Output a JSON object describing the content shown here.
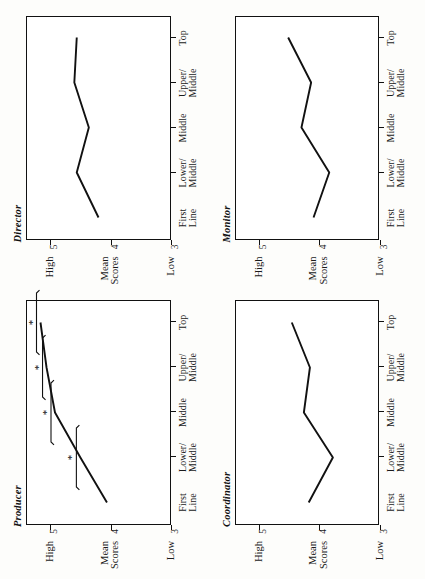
{
  "figure": {
    "orientation": "rotated-90-ccw",
    "layout": "2x2 grid of line charts",
    "y_axis_label_top": "High",
    "y_axis_label_mid_line1": "Mean",
    "y_axis_label_mid_line2": "Scores",
    "y_axis_label_bottom": "Low",
    "ytick_5": "5",
    "ytick_4": "4",
    "ytick_3": "3",
    "significance_marker": "*"
  },
  "categories": [
    {
      "line1": "First",
      "line2": "Line"
    },
    {
      "line1": "Lower/",
      "line2": "Middle"
    },
    {
      "line1": "Middle",
      "line2": ""
    },
    {
      "line1": "Upper/",
      "line2": "Middle"
    },
    {
      "line1": "Top",
      "line2": ""
    }
  ],
  "chart_data": [
    {
      "type": "line",
      "title": "Director",
      "categories": [
        "First Line",
        "Lower/Middle",
        "Middle",
        "Upper/Middle",
        "Top"
      ],
      "values": [
        4.2,
        4.56,
        4.36,
        4.6,
        4.56
      ],
      "xlabel": "",
      "ylabel": "Mean Scores",
      "ylim": [
        3,
        5.4
      ],
      "yticks": [
        3,
        4,
        5
      ],
      "ytick_labels": [
        "3",
        "4",
        "5"
      ],
      "grid": false,
      "legend": "none",
      "annotations": []
    },
    {
      "type": "line",
      "title": "Monitor",
      "categories": [
        "First Line",
        "Lower/Middle",
        "Middle",
        "Upper/Middle",
        "Top"
      ],
      "values": [
        4.1,
        3.84,
        4.3,
        4.14,
        4.52
      ],
      "xlabel": "",
      "ylabel": "Mean Scores",
      "ylim": [
        3,
        5.4
      ],
      "yticks": [
        3,
        4,
        5
      ],
      "ytick_labels": [
        "3",
        "4",
        "5"
      ],
      "grid": false,
      "legend": "none",
      "annotations": []
    },
    {
      "type": "line",
      "title": "Producer",
      "categories": [
        "First Line",
        "Lower/Middle",
        "Middle",
        "Upper/Middle",
        "Top"
      ],
      "values": [
        4.06,
        4.5,
        4.92,
        5.06,
        5.16
      ],
      "xlabel": "",
      "ylabel": "Mean Scores",
      "ylim": [
        3,
        5.4
      ],
      "yticks": [
        3,
        4,
        5
      ],
      "ytick_labels": [
        "3",
        "4",
        "5"
      ],
      "grid": false,
      "legend": "none",
      "annotations": [
        {
          "at_category": 1,
          "marker": "*",
          "bracket": true
        },
        {
          "at_category": 2,
          "marker": "*",
          "bracket": true
        },
        {
          "at_category": 3,
          "marker": "*",
          "bracket": true
        },
        {
          "at_category": 4,
          "marker": "*",
          "bracket": true
        }
      ]
    },
    {
      "type": "line",
      "title": "Coordinator",
      "categories": [
        "First Line",
        "Lower/Middle",
        "Middle",
        "Upper/Middle",
        "Top"
      ],
      "values": [
        4.18,
        3.78,
        4.26,
        4.16,
        4.46
      ],
      "xlabel": "",
      "ylabel": "Mean Scores",
      "ylim": [
        3,
        5.4
      ],
      "yticks": [
        3,
        4,
        5
      ],
      "ytick_labels": [
        "3",
        "4",
        "5"
      ],
      "grid": false,
      "legend": "none",
      "annotations": []
    }
  ]
}
